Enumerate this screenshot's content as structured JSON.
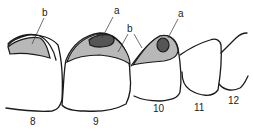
{
  "diagram": {
    "type": "dental-tooth-chart",
    "colors": {
      "outline": "#1a1a1a",
      "region_a": "#555555",
      "region_b": "#b8b8b8",
      "tooth_fill": "#ffffff"
    },
    "callouts": [
      {
        "id": "b-left",
        "label": "b"
      },
      {
        "id": "a-tooth9",
        "label": "a"
      },
      {
        "id": "b-center",
        "label": "b"
      },
      {
        "id": "a-tooth10",
        "label": "a"
      }
    ],
    "teeth": [
      {
        "number": "8"
      },
      {
        "number": "9"
      },
      {
        "number": "10"
      },
      {
        "number": "11"
      },
      {
        "number": "12"
      }
    ]
  }
}
